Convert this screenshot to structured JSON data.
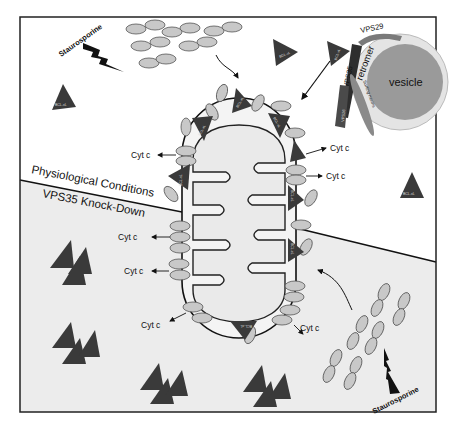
{
  "diagram": {
    "type": "biological-pathway",
    "regions": {
      "top": {
        "label": "Physiological Conditions",
        "background": "#ffffff"
      },
      "bottom": {
        "label": "VPS35 Knock-Down",
        "background": "#eeeeee"
      }
    },
    "labels": {
      "staurosporine_top": "Staurosporine",
      "staurosporine_bottom": "Staurosporine",
      "vesicle": "vesicle",
      "retromer": "retromer",
      "vps29": "VPS29",
      "vps35": "VPS35",
      "vps26": "VPS26",
      "sorting_nexins": "Sorting nexins",
      "bcl_xl": "BCL-xL",
      "bax": "Bax",
      "bak": "Bak",
      "cyt_c": "Cyt c"
    },
    "cyt_c_labels": [
      "Cyt c",
      "Cyt c",
      "Cyt c",
      "Cyt c",
      "Cyt c",
      "Cyt c",
      "Cyt c"
    ],
    "colors": {
      "triangle": "#3a3a3a",
      "oval_fill": "#c8c8c8",
      "oval_stroke": "#555555",
      "vesicle_fill": "#9a9a9a",
      "vesicle_ring": "#e4e4e4",
      "vps29": "#7a7a7a",
      "vps35": "#2e2e2e",
      "vps26": "#4a4a4a",
      "sorting_nexin": "#8a8a8a",
      "mito_fill": "#f2f2f2",
      "frame": "#222222"
    }
  }
}
